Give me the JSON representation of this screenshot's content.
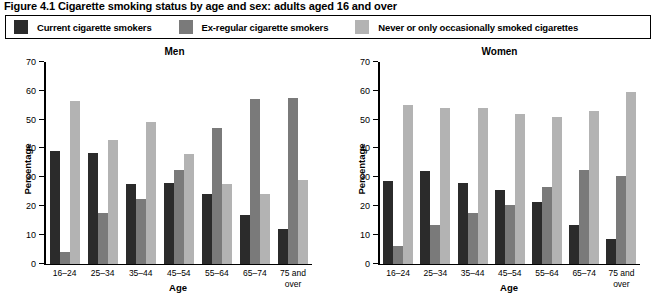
{
  "figure": {
    "title": "Figure 4.1 Cigarette smoking status by age and sex: adults aged 16 and over"
  },
  "legend": {
    "position": "top",
    "items": [
      {
        "label": "Current cigarette smokers",
        "color": "#2b2b2b",
        "swatch_name": "legend-swatch-current"
      },
      {
        "label": "Ex-regular cigarette smokers",
        "color": "#7a7a7a",
        "swatch_name": "legend-swatch-ex-regular"
      },
      {
        "label": "Never or only occasionally smoked cigarettes",
        "color": "#b3b3b3",
        "swatch_name": "legend-swatch-never"
      }
    ]
  },
  "chart_data": {
    "type": "bar",
    "title": "Figure 4.1 Cigarette smoking status by age and sex: adults aged 16 and over",
    "xlabel": "Age",
    "ylabel": "Percentage",
    "ylim": [
      0,
      70
    ],
    "yticks": [
      0,
      10,
      20,
      30,
      40,
      50,
      60,
      70
    ],
    "grid": false,
    "legend_position": "top",
    "categories": [
      "16–24",
      "25–34",
      "35–44",
      "45–54",
      "55–64",
      "65–74",
      "75 and over"
    ],
    "panels": [
      {
        "name": "Men",
        "title": "Men",
        "series": [
          {
            "name": "Current cigarette smokers",
            "color": "#2b2b2b",
            "values": [
              39,
              38.5,
              27.5,
              28,
              24,
              17,
              12
            ]
          },
          {
            "name": "Ex-regular cigarette smokers",
            "color": "#7a7a7a",
            "values": [
              4,
              17.5,
              22.5,
              32.5,
              47,
              57,
              57.5
            ]
          },
          {
            "name": "Never or only occasionally smoked cigarettes",
            "color": "#b3b3b3",
            "values": [
              56.5,
              43,
              49,
              38,
              27.5,
              24,
              29
            ]
          }
        ]
      },
      {
        "name": "Women",
        "title": "Women",
        "series": [
          {
            "name": "Current cigarette smokers",
            "color": "#2b2b2b",
            "values": [
              28.5,
              32,
              28,
              25.5,
              21.5,
              13.5,
              8.5
            ]
          },
          {
            "name": "Ex-regular cigarette smokers",
            "color": "#7a7a7a",
            "values": [
              6,
              13.5,
              17.5,
              20.5,
              26.5,
              32.5,
              30.5
            ]
          },
          {
            "name": "Never or only occasionally smoked cigarettes",
            "color": "#b3b3b3",
            "values": [
              55,
              54,
              54,
              52,
              51,
              53,
              59.5
            ]
          }
        ]
      }
    ]
  }
}
